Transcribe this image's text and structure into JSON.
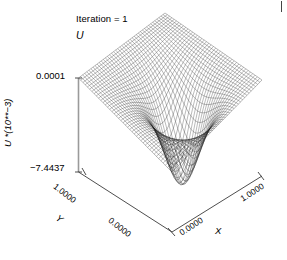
{
  "title": "Iteration = 1",
  "surface_label": "U",
  "axes": {
    "z": {
      "title": "U *(10**−3)",
      "ticks": [
        "0.0001",
        "−7.4437"
      ],
      "max_label": "0.0001",
      "min_label": "−7.4437"
    },
    "y": {
      "title": "Y",
      "ticks": [
        "1.0000",
        "0.0000"
      ],
      "max_label": "1.0000",
      "min_label": "0.0000"
    },
    "x": {
      "title": "X",
      "ticks": [
        "0.0000",
        "1.0000"
      ],
      "min_label": "0.0000",
      "max_label": "1.0000"
    }
  },
  "colors": {
    "mesh": "#1a1a1a",
    "axis": "#808080",
    "text": "#000000",
    "background": "#ffffff"
  },
  "chart_data": {
    "type": "surface",
    "title": "Iteration = 1",
    "xlabel": "X",
    "ylabel": "Y",
    "zlabel": "U *(10**−3)",
    "xlim": [
      0.0,
      1.0
    ],
    "ylim": [
      0.0,
      1.0
    ],
    "zlim": [
      -7.4437,
      0.0001
    ],
    "grid": false,
    "legend": null,
    "mesh_n": 42,
    "z_min": -7.4437,
    "z_max": 0.0001,
    "z_scale": "10**-3",
    "well_center": [
      0.5,
      0.35
    ],
    "well_depth": -7.4437,
    "boundary_value": 0.0001,
    "x": [
      0.0,
      0.1,
      0.2,
      0.3,
      0.4,
      0.5,
      0.6,
      0.7,
      0.8,
      0.9,
      1.0
    ],
    "y": [
      0.0,
      0.1,
      0.2,
      0.3,
      0.4,
      0.5,
      0.6,
      0.7,
      0.8,
      0.9,
      1.0
    ],
    "z": [
      [
        0.0001,
        0.0001,
        0.0001,
        0.0001,
        0.0001,
        0.0001,
        0.0001,
        0.0001,
        0.0001,
        0.0001,
        0.0001
      ],
      [
        0.0001,
        -0.21,
        -0.52,
        -0.93,
        -1.32,
        -1.48,
        -1.32,
        -0.93,
        -0.52,
        -0.21,
        0.0001
      ],
      [
        0.0001,
        -0.44,
        -1.21,
        -2.34,
        -3.41,
        -3.88,
        -3.41,
        -2.34,
        -1.21,
        -0.44,
        0.0001
      ],
      [
        0.0001,
        -0.62,
        -1.88,
        -3.96,
        -6.12,
        -7.12,
        -6.12,
        -3.96,
        -1.88,
        -0.62,
        0.0001
      ],
      [
        0.0001,
        -0.58,
        -1.74,
        -3.72,
        -6.41,
        -7.4437,
        -6.41,
        -3.72,
        -1.74,
        -0.58,
        0.0001
      ],
      [
        0.0001,
        -0.44,
        -1.22,
        -2.41,
        -3.92,
        -4.68,
        -3.92,
        -2.41,
        -1.22,
        -0.44,
        0.0001
      ],
      [
        0.0001,
        -0.31,
        -0.8,
        -1.46,
        -2.14,
        -2.46,
        -2.14,
        -1.46,
        -0.8,
        -0.31,
        0.0001
      ],
      [
        0.0001,
        -0.21,
        -0.51,
        -0.88,
        -1.24,
        -1.4,
        -1.24,
        -0.88,
        -0.51,
        -0.21,
        0.0001
      ],
      [
        0.0001,
        -0.13,
        -0.3,
        -0.5,
        -0.68,
        -0.76,
        -0.68,
        -0.5,
        -0.3,
        -0.13,
        0.0001
      ],
      [
        0.0001,
        -0.06,
        -0.13,
        -0.21,
        -0.28,
        -0.31,
        -0.28,
        -0.21,
        -0.13,
        -0.06,
        0.0001
      ],
      [
        0.0001,
        0.0001,
        0.0001,
        0.0001,
        0.0001,
        0.0001,
        0.0001,
        0.0001,
        0.0001,
        0.0001,
        0.0001
      ]
    ]
  }
}
